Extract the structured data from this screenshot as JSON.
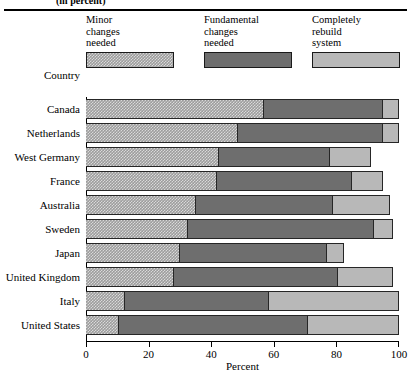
{
  "header": {
    "subtitle": "(in percent)"
  },
  "legend": {
    "position": "top",
    "items": [
      {
        "label": "Minor\nchanges\nneeded",
        "swatch": "minor-swatch",
        "color": "#9d9d9d"
      },
      {
        "label": "Fundamental\nchanges\nneeded",
        "swatch": "fundamental-swatch",
        "color": "#6e6e6e"
      },
      {
        "label": "Completely\nrebuild\nsystem",
        "swatch": "rebuild-swatch",
        "color": "#b8b8b8"
      }
    ]
  },
  "axes": {
    "y_title": "Country",
    "x_title": "Percent",
    "x_ticks": [
      "0",
      "20",
      "40",
      "60",
      "80",
      "100"
    ]
  },
  "chart_data": {
    "type": "bar",
    "orientation": "horizontal",
    "stacked": true,
    "title": "(in percent)",
    "xlabel": "Percent",
    "ylabel": "Country",
    "xlim": [
      0,
      100
    ],
    "grid": false,
    "legend_position": "top",
    "categories": [
      "Canada",
      "Netherlands",
      "West Germany",
      "France",
      "Australia",
      "Sweden",
      "Japan",
      "United Kingdom",
      "Italy",
      "United States"
    ],
    "series": [
      {
        "name": "Minor changes needed",
        "color": "#9d9d9d",
        "values": [
          57,
          48.5,
          42.5,
          42,
          35,
          32.5,
          30,
          28,
          12.5,
          10.5
        ]
      },
      {
        "name": "Fundamental changes needed",
        "color": "#6e6e6e",
        "values": [
          38,
          46.5,
          35.5,
          43,
          44,
          59.5,
          47,
          52.5,
          46,
          60.5
        ]
      },
      {
        "name": "Completely rebuild system",
        "color": "#b8b8b8",
        "values": [
          5,
          5,
          13,
          10,
          18,
          6,
          5.5,
          17.5,
          41.5,
          29
        ]
      }
    ],
    "totals": [
      100,
      100,
      91,
      95,
      97,
      98,
      82.5,
      98,
      100,
      100
    ]
  }
}
